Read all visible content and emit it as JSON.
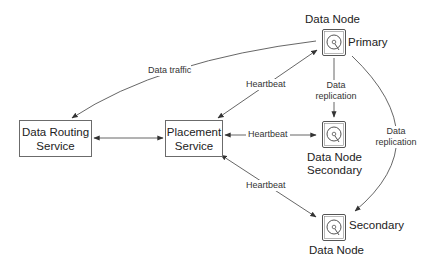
{
  "diagram": {
    "nodes": {
      "data_routing": {
        "line1": "Data Routing",
        "line2": "Service"
      },
      "placement": {
        "line1": "Placement",
        "line2": "Service"
      },
      "primary": {
        "title": "Data Node",
        "role": "Primary"
      },
      "secondary_mid": {
        "title": "Data Node",
        "role": "Secondary"
      },
      "secondary_bottom": {
        "title": "Data Node",
        "role": "Secondary"
      }
    },
    "edges": {
      "data_traffic": "Data traffic",
      "heartbeat_primary": "Heartbeat",
      "heartbeat_secondary_mid": "Heartbeat",
      "heartbeat_secondary_bottom": "Heartbeat",
      "replication_mid": {
        "line1": "Data",
        "line2": "replication"
      },
      "replication_bottom": {
        "line1": "Data",
        "line2": "replication"
      }
    },
    "colors": {
      "line": "#444444",
      "box_border": "#6b6b6b",
      "text": "#222222"
    }
  }
}
